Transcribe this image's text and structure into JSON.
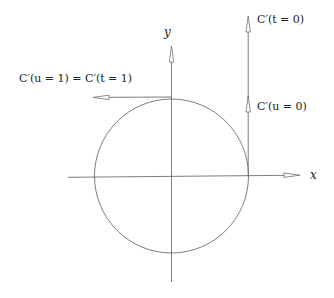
{
  "diagram": {
    "type": "circle-tangent-vectors",
    "colors": {
      "stroke": "#6e6e6e",
      "text": "#222222",
      "background": "#ffffff"
    },
    "axes": {
      "x_label": "x",
      "y_label": "y"
    },
    "labels": {
      "top_tangent": "C′(u = 1) = C′(t = 1)",
      "right_tangent_long": "C′(t = 0)",
      "right_tangent_short": "C′(u = 0)"
    },
    "geometry": {
      "origin": [
        171.5,
        176
      ],
      "radius": 77
    }
  }
}
